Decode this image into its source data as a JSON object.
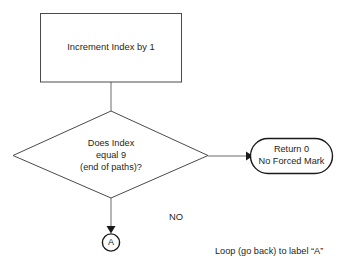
{
  "diagram": {
    "type": "flowchart",
    "title": "",
    "background_color": "#ffffff",
    "stroke_color": "#4a4a4a",
    "text_color": "#231f20",
    "nodes": {
      "process": {
        "shape": "rectangle",
        "label": "Increment Index by 1"
      },
      "decision": {
        "shape": "diamond",
        "line1": "Does Index",
        "line2": "equal 9",
        "line3": "(end of paths)?"
      },
      "terminal": {
        "shape": "rounded-rectangle",
        "line1": "Return 0",
        "line2": "No Forced Mark"
      },
      "connector_a": {
        "shape": "circle",
        "label": "A"
      }
    },
    "edge_labels": {
      "no_branch": "NO"
    },
    "notes": {
      "loop_note": "Loop (go back) to label “A”"
    }
  }
}
